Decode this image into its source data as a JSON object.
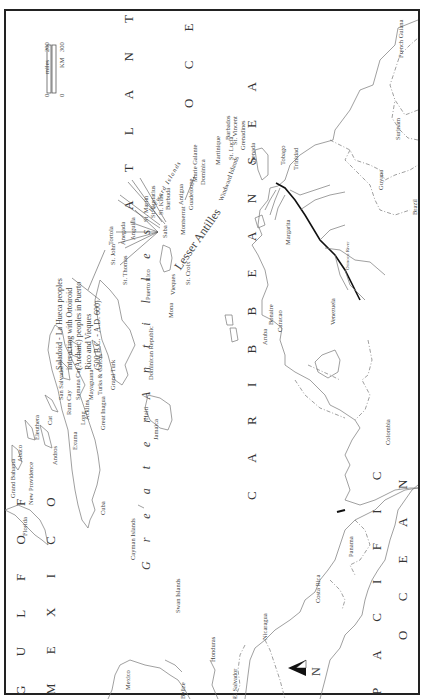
{
  "map": {
    "orientation": "rotated 90° counter-clockwise (north points left)",
    "north_arrow": {
      "label": "N"
    },
    "scale_bar": {
      "miles_label": "miles",
      "miles_min": "0",
      "miles_max": "200",
      "km_label": "KM",
      "km_min": "0",
      "km_max": "300"
    },
    "water_bodies": {
      "atlantic": "A T L A N T I C",
      "atlantic_ocean": "O C E A N",
      "gulf": "G U L F   O F",
      "mexico": "M E X I C O",
      "caribbean": "C A R I B B E A N   S E A",
      "pacific": "P A C I F I C",
      "pacific_ocean": "O C E A N"
    },
    "regions": {
      "greater_antilles": "G r e a t e r   A n t i l l e s",
      "lesser_antilles": "Lesser Antilles",
      "leeward_islands": "Leeward Islands",
      "windward_islands": "Windward Islands"
    },
    "annotation": {
      "line1": "Saladoid - La Hueca peoples",
      "line2": "interacting with Ortoiroid",
      "line3": "(Archaic) peoples in Puerto",
      "line4": "Rico and Vieques",
      "line5": "(500 B.C. - A.D. 600)"
    },
    "places": {
      "grand_bahama": "Grand Bahama",
      "abaco": "Abaco",
      "new_providence": "New Providence",
      "florida": "Florida",
      "eleuthera": "Eleuthera",
      "cat": "Cat",
      "andros": "Andros",
      "exuma": "Exuma",
      "long": "Long",
      "san_salvador": "San Salvador",
      "rum_cay": "Rum Cay",
      "samana_cay": "Samana Cay",
      "acklins": "Acklins",
      "mayaguana": "Mayaguana",
      "great_inagua": "Great Inagua",
      "turks_caicos": "Turks & Caicos",
      "grand_turk": "Grand Turk",
      "cuba": "Cuba",
      "cayman": "Cayman Islands",
      "jamaica": "Jamaica",
      "haiti": "Haiti",
      "dominican_republic": "Dominican Republic",
      "puerto_rico": "Puerto Rico",
      "mona": "Mona",
      "vieques": "Vieques",
      "st_croix": "St. Croix",
      "st_thomas": "St. Thomas",
      "st_john": "St. John",
      "tortola": "Tortola",
      "anegada": "Anegada",
      "anguilla": "Anguilla",
      "st_martin": "St. Martin",
      "st_eustatius": "St. Eustatius",
      "st_kitts": "St. Kitts",
      "barbuda": "Barbuda",
      "saba": "Saba",
      "antigua": "Antigua",
      "montserrat": "Montserrat",
      "guadeloupe": "Guadeloupe",
      "marie_galante": "Marie Galante",
      "dominica": "Dominica",
      "martinique": "Martinique",
      "st_lucia": "St. Lucia",
      "barbados": "Barbados",
      "st_vincent": "St. Vincent",
      "grenadines": "Grenadines",
      "grenada": "Grenada",
      "tobago": "Tobago",
      "trinidad": "Trinidad",
      "margarita": "Margarita",
      "aruba": "Aruba",
      "bonaire": "Bonaire",
      "curacao": "Curacao",
      "venezuela": "Venezuela",
      "orinoco": "Orinoco River",
      "guyana": "Guyana",
      "surinam": "Surinam",
      "french_guiana": "French Guiana",
      "brazil": "Brazil",
      "colombia": "Colombia",
      "panama": "Panama",
      "costa_rica": "Costa Rica",
      "nicaragua": "Nicaragua",
      "honduras": "Honduras",
      "el_salvador": "El Salvador",
      "belize": "Belize",
      "mexico_country": "Mexico",
      "swan_islands": "Swan Islands"
    }
  }
}
